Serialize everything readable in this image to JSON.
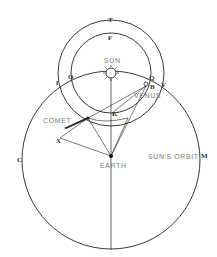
{
  "diagram": {
    "labels": {
      "sun": "SUN",
      "venus": "VENUS",
      "comet": "COMET",
      "earth": "EARTH",
      "suns_orbit": "SUN'S ORBIT"
    },
    "letters": {
      "T": "T",
      "F": "F",
      "O": "O",
      "left_outer": "f",
      "Q": "Q",
      "V": "V",
      "B": "B",
      "K": "K",
      "X": "X",
      "C": "C",
      "M": "M"
    },
    "colors": {
      "line": "#222222",
      "label": "#7a7a7a",
      "background": "#ffffff"
    }
  }
}
